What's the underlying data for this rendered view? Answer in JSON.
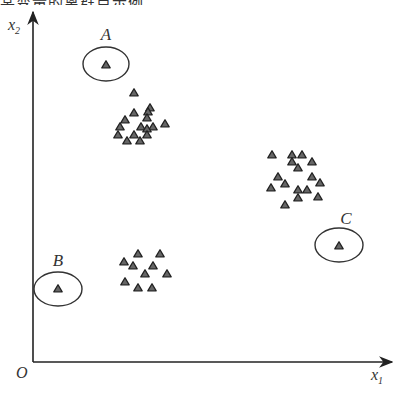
{
  "chart_data": {
    "type": "scatter",
    "title": "",
    "xlabel": "x1",
    "ylabel": "x2",
    "origin_label": "O",
    "grid": false,
    "legend": null,
    "axis": {
      "origin_px": [
        33,
        362
      ],
      "x_end_px": 392,
      "y_end_px": 12
    },
    "outliers": [
      {
        "label": "A",
        "x": 106,
        "y": 65,
        "ellipse": {
          "cx": 106,
          "cy": 64,
          "rx": 23,
          "ry": 17
        },
        "label_pos": [
          106,
          40
        ]
      },
      {
        "label": "B",
        "x": 58,
        "y": 289,
        "ellipse": {
          "cx": 58,
          "cy": 289,
          "rx": 24,
          "ry": 17
        },
        "label_pos": [
          58,
          266
        ]
      },
      {
        "label": "C",
        "x": 339,
        "y": 246,
        "ellipse": {
          "cx": 339,
          "cy": 245,
          "rx": 24,
          "ry": 17
        },
        "label_pos": [
          346,
          224
        ]
      }
    ],
    "clusters": [
      {
        "name": "upper-left cluster",
        "points": [
          [
            134,
            93
          ],
          [
            134,
            113
          ],
          [
            150,
            108
          ],
          [
            148,
            112
          ],
          [
            125,
            120
          ],
          [
            147,
            118
          ],
          [
            165,
            124
          ],
          [
            120,
            127
          ],
          [
            141,
            127
          ],
          [
            153,
            127
          ],
          [
            147,
            129
          ],
          [
            118,
            135
          ],
          [
            134,
            135
          ],
          [
            147,
            135
          ],
          [
            127,
            141
          ],
          [
            140,
            141
          ]
        ]
      },
      {
        "name": "right cluster",
        "points": [
          [
            272,
            155
          ],
          [
            292,
            155
          ],
          [
            302,
            155
          ],
          [
            292,
            162
          ],
          [
            312,
            162
          ],
          [
            298,
            168
          ],
          [
            278,
            177
          ],
          [
            312,
            177
          ],
          [
            285,
            184
          ],
          [
            320,
            183
          ],
          [
            271,
            188
          ],
          [
            298,
            190
          ],
          [
            307,
            190
          ],
          [
            318,
            197
          ],
          [
            298,
            198
          ],
          [
            285,
            205
          ]
        ]
      },
      {
        "name": "lower-left cluster",
        "points": [
          [
            138,
            254
          ],
          [
            160,
            254
          ],
          [
            124,
            262
          ],
          [
            133,
            266
          ],
          [
            153,
            266
          ],
          [
            145,
            274
          ],
          [
            167,
            274
          ],
          [
            125,
            282
          ],
          [
            138,
            288
          ],
          [
            152,
            288
          ]
        ]
      }
    ],
    "colors": {
      "axis": "#222222",
      "marker_fill": "#666666",
      "marker_stroke": "#222222",
      "ellipse": "#333333",
      "text": "#333333"
    }
  },
  "header": {
    "cut_text": "某变量的离群点示例"
  }
}
